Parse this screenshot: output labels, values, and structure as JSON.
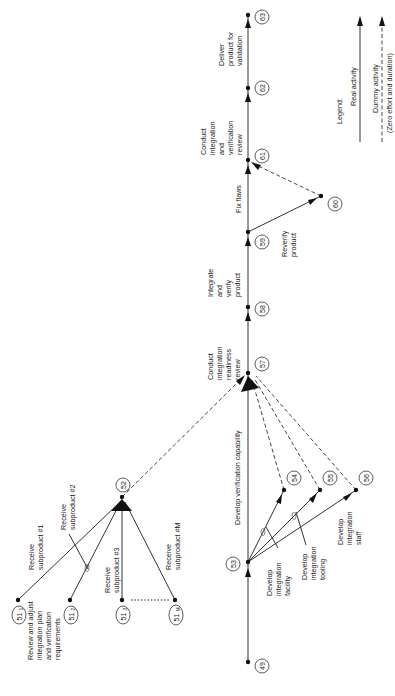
{
  "diagram": {
    "type": "activity-on-arrow network (rotated 90° counter-clockwise)",
    "orientation": "rotated-ccw-90",
    "nodes": [
      {
        "id": "49",
        "label": "49"
      },
      {
        "id": "51_1",
        "label": "51",
        "sub": "1"
      },
      {
        "id": "51_2",
        "label": "51",
        "sub": "2"
      },
      {
        "id": "51_3",
        "label": "51",
        "sub": "3"
      },
      {
        "id": "51_M",
        "label": "51",
        "sub": "M"
      },
      {
        "id": "52",
        "label": "52"
      },
      {
        "id": "53",
        "label": "53"
      },
      {
        "id": "54",
        "label": "54"
      },
      {
        "id": "55",
        "label": "55"
      },
      {
        "id": "56",
        "label": "56"
      },
      {
        "id": "57",
        "label": "57"
      },
      {
        "id": "58",
        "label": "58"
      },
      {
        "id": "59",
        "label": "59"
      },
      {
        "id": "60",
        "label": "60"
      },
      {
        "id": "61",
        "label": "61"
      },
      {
        "id": "62",
        "label": "62"
      },
      {
        "id": "63",
        "label": "63"
      }
    ],
    "activities": {
      "review_plan": [
        "Review and adjust",
        "integration plan",
        "and verification",
        "requirements"
      ],
      "develop_verification": [
        "Develop verification capability"
      ],
      "dev_facility": [
        "Develop",
        "integration",
        "facility"
      ],
      "dev_tooling": [
        "Develop",
        "integration",
        "tooling"
      ],
      "dev_staff": [
        "Develop",
        "integration",
        "staff"
      ],
      "recv_1": [
        "Receive",
        "subproduct #1"
      ],
      "recv_2": [
        "Receive",
        "subproduct #2"
      ],
      "recv_3": [
        "Receive",
        "subproduct #3"
      ],
      "recv_m": [
        "Receive",
        "subproduct #M"
      ],
      "readiness_review": [
        "Conduct",
        "integration",
        "readiness",
        "review"
      ],
      "integrate_verify": [
        "Integrate",
        "and",
        "verify",
        "product"
      ],
      "fix_flaws": [
        "Fix flaws"
      ],
      "reverify": [
        "Reverify",
        "product"
      ],
      "iv_review": [
        "Conduct",
        "integration",
        "and",
        "verification",
        "review"
      ],
      "deliver": [
        "Deliver",
        "product for",
        "validation"
      ]
    },
    "edges": [
      {
        "from": "49",
        "to": "53",
        "kind": "real",
        "activity": "review_plan"
      },
      {
        "from": "53",
        "to": "57",
        "kind": "real",
        "activity": "develop_verification"
      },
      {
        "from": "53",
        "to": "54",
        "kind": "real",
        "activity": "dev_facility"
      },
      {
        "from": "53",
        "to": "55",
        "kind": "real",
        "activity": "dev_tooling"
      },
      {
        "from": "53",
        "to": "56",
        "kind": "real",
        "activity": "dev_staff"
      },
      {
        "from": "54",
        "to": "57",
        "kind": "dummy"
      },
      {
        "from": "55",
        "to": "57",
        "kind": "dummy"
      },
      {
        "from": "56",
        "to": "57",
        "kind": "dummy"
      },
      {
        "from": "51_1",
        "to": "52",
        "kind": "real",
        "activity": "recv_1"
      },
      {
        "from": "51_2",
        "to": "52",
        "kind": "real",
        "activity": "recv_2"
      },
      {
        "from": "51_3",
        "to": "52",
        "kind": "real",
        "activity": "recv_3"
      },
      {
        "from": "51_M",
        "to": "52",
        "kind": "real",
        "activity": "recv_m"
      },
      {
        "from": "51_3",
        "to": "51_M",
        "kind": "ellipsis"
      },
      {
        "from": "52",
        "to": "57",
        "kind": "dummy"
      },
      {
        "from": "57",
        "to": "58",
        "kind": "real",
        "activity": "readiness_review"
      },
      {
        "from": "58",
        "to": "59",
        "kind": "real",
        "activity": "integrate_verify"
      },
      {
        "from": "59",
        "to": "61",
        "kind": "real",
        "activity": "fix_flaws"
      },
      {
        "from": "59",
        "to": "60",
        "kind": "real",
        "activity": "reverify"
      },
      {
        "from": "60",
        "to": "61",
        "kind": "dummy"
      },
      {
        "from": "61",
        "to": "62",
        "kind": "real",
        "activity": "iv_review"
      },
      {
        "from": "62",
        "to": "63",
        "kind": "real",
        "activity": "deliver"
      }
    ]
  },
  "legend": {
    "title": "Legend:",
    "real": "Real activity",
    "dummy": "Dummy activity",
    "dummy_note": "(Zero effort and duration)"
  }
}
